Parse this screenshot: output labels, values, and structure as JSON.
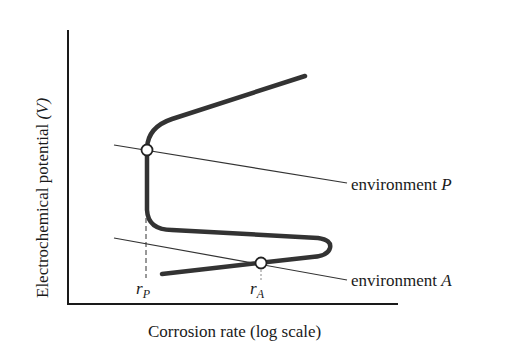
{
  "diagram": {
    "type": "polarization-curve",
    "y_axis": {
      "label": "Electrochemical potential",
      "unit": "(V)"
    },
    "x_axis": {
      "label": "Corrosion rate (log scale)"
    },
    "environments": [
      {
        "name": "environment",
        "symbol": "P"
      },
      {
        "name": "environment",
        "symbol": "A"
      }
    ],
    "rate_markers": [
      {
        "base": "r",
        "sub": "P"
      },
      {
        "base": "r",
        "sub": "A"
      }
    ],
    "colors": {
      "curve": "#333333",
      "lines": "#333333",
      "axis": "#1a1a1a",
      "background": "#ffffff"
    }
  }
}
